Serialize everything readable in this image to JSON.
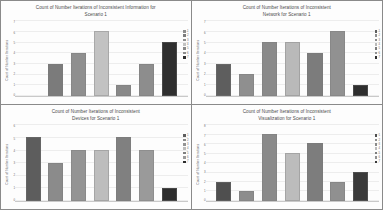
{
  "figure": {
    "layout": "2x2 grid of bar charts",
    "panel_count": 4
  },
  "chart_data": [
    {
      "id": "information",
      "type": "bar",
      "title": "Count of Number Iterations of Inconsistent Information for Scenario 1",
      "title_line1": "Count of Number Iterations of Inconsistent Information for",
      "title_line2": "Scenario 1",
      "xlabel": "",
      "ylabel": "Count of Number Iterations",
      "categories": [
        "1",
        "2",
        "3",
        "4",
        "5",
        "6",
        "7"
      ],
      "values": [
        0,
        3,
        4,
        6,
        1,
        3,
        5
      ],
      "colors": [
        "#8c8c8c",
        "#7b7b7b",
        "#8f8f8f",
        "#c2c2c2",
        "#898989",
        "#8d8d8d",
        "#2f2f2f"
      ],
      "yticks": [
        "7",
        "6",
        "5",
        "4",
        "3",
        "2",
        "1",
        "0"
      ],
      "ylim": [
        0,
        7
      ],
      "grid": true,
      "legend": [
        "1",
        "2",
        "3",
        "4",
        "5",
        "6",
        "7"
      ],
      "legend_position": "right"
    },
    {
      "id": "network",
      "type": "bar",
      "title": "Count of Number Iterations of Inconsistent Network for Scenario 1",
      "title_line1": "Count of Number Iterations of Inconsistent",
      "title_line2": "Network for Scenario 1",
      "xlabel": "",
      "ylabel": "Count of Number Iterations",
      "categories": [
        "1",
        "2",
        "3",
        "4",
        "5",
        "6",
        "7"
      ],
      "values": [
        3,
        2,
        5,
        5,
        4,
        6,
        1
      ],
      "colors": [
        "#5e5e5e",
        "#8f8f8f",
        "#8a8a8a",
        "#b9b9b9",
        "#7c7c7c",
        "#919191",
        "#2e2e2e"
      ],
      "yticks": [
        "7",
        "6",
        "5",
        "4",
        "3",
        "2",
        "1",
        "0"
      ],
      "ylim": [
        0,
        7
      ],
      "grid": true,
      "legend": [
        "1",
        "2",
        "3",
        "4",
        "5",
        "6",
        "7"
      ],
      "legend_position": "right"
    },
    {
      "id": "devices",
      "type": "bar",
      "title": "Count of Number Iterations of Inconsistent Devices for Scenario 1",
      "title_line1": "Count of Number Iterations of Inconsistent",
      "title_line2": "Devices for Scenario 1",
      "xlabel": "",
      "ylabel": "Count of Number Iterations",
      "categories": [
        "1",
        "2",
        "3",
        "4",
        "5",
        "6",
        "7"
      ],
      "values": [
        5,
        3,
        4,
        4,
        5,
        4,
        1
      ],
      "colors": [
        "#5d5d5d",
        "#8b8b8b",
        "#949494",
        "#bdbdbd",
        "#808080",
        "#9a9a9a",
        "#2d2d2d"
      ],
      "yticks": [
        "6",
        "5",
        "4",
        "3",
        "2",
        "1",
        "0"
      ],
      "ylim": [
        0,
        6
      ],
      "grid": true,
      "legend": [
        "1",
        "2",
        "3",
        "4",
        "5",
        "6",
        "7"
      ],
      "legend_position": "right"
    },
    {
      "id": "visualization",
      "type": "bar",
      "title": "Count of Number Iterations of Inconsistent Visualization for Scenario 1",
      "title_line1": "Count of Number Iterations of Inconsistent",
      "title_line2": "Visualization for Scenario 1",
      "xlabel": "",
      "ylabel": "Count of Number Iterations",
      "categories": [
        "1",
        "2",
        "3",
        "4",
        "5",
        "6",
        "7"
      ],
      "values": [
        2,
        1,
        7,
        5,
        6,
        2,
        3
      ],
      "colors": [
        "#4f4f4f",
        "#8d8d8d",
        "#8a8a8a",
        "#bcbcbc",
        "#7d7d7d",
        "#909090",
        "#3a3a3a"
      ],
      "yticks": [
        "8",
        "7",
        "6",
        "5",
        "4",
        "3",
        "2",
        "1",
        "0"
      ],
      "ylim": [
        0,
        8
      ],
      "grid": true,
      "legend": [
        "1",
        "2",
        "3",
        "4",
        "5",
        "6",
        "7"
      ],
      "legend_position": "right"
    }
  ]
}
